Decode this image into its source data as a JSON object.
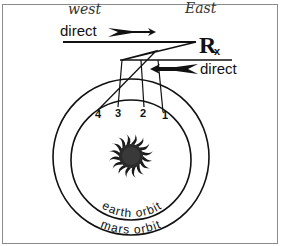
{
  "diagram": {
    "annotations": {
      "west": "west",
      "east": "East"
    },
    "labels": {
      "direct_top": "direct",
      "direct_right": "direct",
      "retrograde_symbol": "R",
      "retrograde_subscript": "x",
      "earth_orbit": "earth orbit",
      "mars_orbit": "mars orbit"
    },
    "positions": [
      "1",
      "2",
      "3",
      "4"
    ],
    "icons": {
      "sun": "sun-icon",
      "arrow_right": "arrow-right-icon",
      "arrow_left": "arrow-left-icon"
    },
    "colors": {
      "ink": "#111111",
      "border": "#8a8a8a",
      "background": "#ffffff"
    }
  }
}
